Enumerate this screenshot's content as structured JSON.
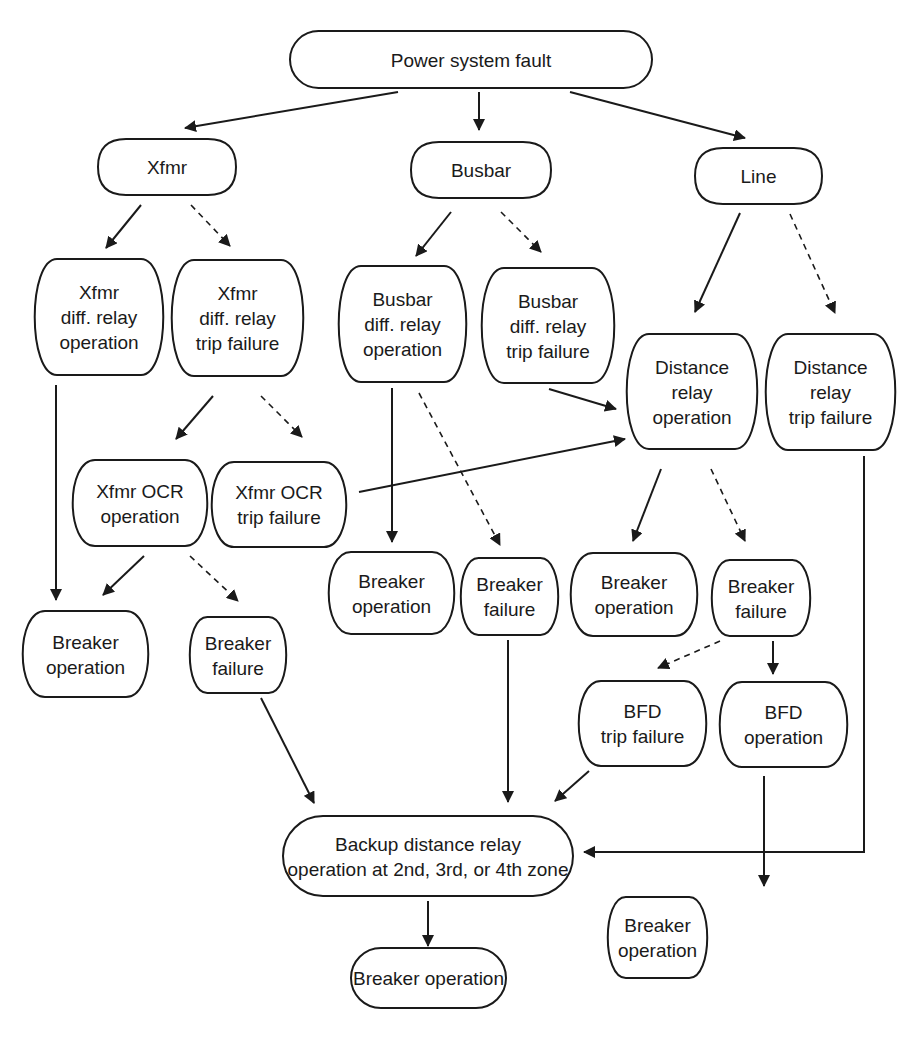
{
  "diagram": {
    "colors": {
      "stroke": "#1a1a1a",
      "fill": "#ffffff",
      "text": "#1a1a1a"
    },
    "nodes": [
      {
        "id": "fault",
        "shape": "pill",
        "x": 290,
        "y": 31,
        "w": 362,
        "h": 57,
        "lines": [
          "Power system fault"
        ]
      },
      {
        "id": "xfmr",
        "shape": "rounded",
        "x": 98,
        "y": 139,
        "w": 138,
        "h": 56,
        "lines": [
          "Xfmr"
        ]
      },
      {
        "id": "busbar",
        "shape": "rounded",
        "x": 411,
        "y": 142,
        "w": 140,
        "h": 56,
        "lines": [
          "Busbar"
        ]
      },
      {
        "id": "line",
        "shape": "rounded",
        "x": 695,
        "y": 148,
        "w": 127,
        "h": 56,
        "lines": [
          "Line"
        ]
      },
      {
        "id": "xfmr_diff_op",
        "shape": "barrel",
        "x": 35,
        "y": 259,
        "w": 128,
        "h": 116,
        "lines": [
          "Xfmr",
          "diff. relay",
          "operation"
        ]
      },
      {
        "id": "xfmr_diff_fail",
        "shape": "barrel",
        "x": 172,
        "y": 260,
        "w": 131,
        "h": 116,
        "lines": [
          "Xfmr",
          "diff. relay",
          "trip failure"
        ]
      },
      {
        "id": "busbar_diff_op",
        "shape": "barrel",
        "x": 339,
        "y": 266,
        "w": 127,
        "h": 116,
        "lines": [
          "Busbar",
          "diff. relay",
          "operation"
        ]
      },
      {
        "id": "busbar_diff_fail",
        "shape": "barrel",
        "x": 482,
        "y": 268,
        "w": 132,
        "h": 115,
        "lines": [
          "Busbar",
          "diff. relay",
          "trip failure"
        ]
      },
      {
        "id": "dist_op",
        "shape": "barrel",
        "x": 627,
        "y": 334,
        "w": 130,
        "h": 115,
        "lines": [
          "Distance",
          "relay",
          "operation"
        ]
      },
      {
        "id": "dist_fail",
        "shape": "barrel",
        "x": 766,
        "y": 334,
        "w": 129,
        "h": 116,
        "lines": [
          "Distance",
          "relay",
          "trip failure"
        ]
      },
      {
        "id": "xfmr_ocr_op",
        "shape": "barrel",
        "x": 73,
        "y": 460,
        "w": 134,
        "h": 86,
        "lines": [
          "Xfmr OCR",
          "operation"
        ]
      },
      {
        "id": "xfmr_ocr_fail",
        "shape": "barrel",
        "x": 212,
        "y": 462,
        "w": 134,
        "h": 85,
        "lines": [
          "Xfmr OCR",
          "trip failure"
        ]
      },
      {
        "id": "brk_op_busbar",
        "shape": "barrel",
        "x": 329,
        "y": 552,
        "w": 125,
        "h": 82,
        "lines": [
          "Breaker",
          "operation"
        ]
      },
      {
        "id": "brk_fail_busbar",
        "shape": "barrel",
        "x": 461,
        "y": 558,
        "w": 97,
        "h": 77,
        "lines": [
          "Breaker",
          "failure"
        ]
      },
      {
        "id": "brk_op_dist",
        "shape": "barrel",
        "x": 571,
        "y": 553,
        "w": 126,
        "h": 83,
        "lines": [
          "Breaker",
          "operation"
        ]
      },
      {
        "id": "brk_fail_dist",
        "shape": "barrel",
        "x": 712,
        "y": 560,
        "w": 98,
        "h": 76,
        "lines": [
          "Breaker",
          "failure"
        ]
      },
      {
        "id": "brk_op_left",
        "shape": "barrel",
        "x": 23,
        "y": 611,
        "w": 125,
        "h": 86,
        "lines": [
          "Breaker",
          "operation"
        ]
      },
      {
        "id": "brk_fail_left",
        "shape": "barrel",
        "x": 190,
        "y": 617,
        "w": 96,
        "h": 76,
        "lines": [
          "Breaker",
          "failure"
        ]
      },
      {
        "id": "bfd_fail",
        "shape": "barrel",
        "x": 579,
        "y": 681,
        "w": 127,
        "h": 85,
        "lines": [
          "BFD",
          "trip failure"
        ]
      },
      {
        "id": "bfd_op",
        "shape": "barrel",
        "x": 720,
        "y": 682,
        "w": 127,
        "h": 85,
        "lines": [
          "BFD",
          "operation"
        ]
      },
      {
        "id": "backup",
        "shape": "pill",
        "x": 283,
        "y": 816,
        "w": 290,
        "h": 80,
        "lines": [
          "Backup distance relay",
          "operation at 2nd, 3rd, or 4th zone"
        ]
      },
      {
        "id": "brk_op_bottom",
        "shape": "pill",
        "x": 351,
        "y": 948,
        "w": 155,
        "h": 60,
        "lines": [
          "Breaker operation"
        ]
      },
      {
        "id": "brk_op_right",
        "shape": "barrel",
        "x": 608,
        "y": 897,
        "w": 99,
        "h": 81,
        "lines": [
          "Breaker",
          "operation"
        ]
      }
    ],
    "edges": [
      {
        "from": "fault",
        "to": "xfmr",
        "style": "solid",
        "points": [
          [
            398,
            92
          ],
          [
            185,
            128
          ]
        ]
      },
      {
        "from": "fault",
        "to": "busbar",
        "style": "solid",
        "points": [
          [
            479,
            92
          ],
          [
            479,
            130
          ]
        ]
      },
      {
        "from": "fault",
        "to": "line",
        "style": "solid",
        "points": [
          [
            570,
            92
          ],
          [
            745,
            138
          ]
        ]
      },
      {
        "from": "xfmr",
        "to": "xfmr_diff_op",
        "style": "solid",
        "points": [
          [
            141,
            205
          ],
          [
            106,
            248
          ]
        ]
      },
      {
        "from": "xfmr",
        "to": "xfmr_diff_fail",
        "style": "dashed",
        "points": [
          [
            191,
            205
          ],
          [
            230,
            246
          ]
        ]
      },
      {
        "from": "busbar",
        "to": "busbar_diff_op",
        "style": "solid",
        "points": [
          [
            451,
            212
          ],
          [
            416,
            256
          ]
        ]
      },
      {
        "from": "busbar",
        "to": "busbar_diff_fail",
        "style": "dashed",
        "points": [
          [
            501,
            212
          ],
          [
            541,
            252
          ]
        ]
      },
      {
        "from": "line",
        "to": "dist_op",
        "style": "solid",
        "points": [
          [
            740,
            213
          ],
          [
            695,
            312
          ]
        ]
      },
      {
        "from": "line",
        "to": "dist_fail",
        "style": "dashed",
        "points": [
          [
            790,
            214
          ],
          [
            835,
            313
          ]
        ]
      },
      {
        "from": "xfmr_diff_fail",
        "to": "xfmr_ocr_op",
        "style": "solid",
        "points": [
          [
            213,
            396
          ],
          [
            176,
            439
          ]
        ]
      },
      {
        "from": "xfmr_diff_fail",
        "to": "xfmr_ocr_fail",
        "style": "dashed",
        "points": [
          [
            261,
            396
          ],
          [
            302,
            437
          ]
        ]
      },
      {
        "from": "busbar_diff_fail",
        "to": "dist_op",
        "style": "solid",
        "points": [
          [
            549,
            389
          ],
          [
            616,
            409
          ]
        ]
      },
      {
        "from": "xfmr_ocr_fail",
        "to": "dist_op",
        "style": "solid",
        "points": [
          [
            359,
            492
          ],
          [
            625,
            439
          ]
        ]
      },
      {
        "from": "xfmr_diff_op",
        "to": "brk_op_left",
        "style": "solid",
        "points": [
          [
            56,
            385
          ],
          [
            56,
            600
          ]
        ]
      },
      {
        "from": "busbar_diff_op",
        "to": "brk_op_busbar",
        "style": "solid",
        "points": [
          [
            392,
            388
          ],
          [
            392,
            542
          ]
        ]
      },
      {
        "from": "busbar_diff_op",
        "to": "brk_fail_busbar",
        "style": "dashed",
        "points": [
          [
            419,
            393
          ],
          [
            500,
            545
          ]
        ]
      },
      {
        "from": "dist_op",
        "to": "brk_op_dist",
        "style": "solid",
        "points": [
          [
            661,
            469
          ],
          [
            633,
            541
          ]
        ]
      },
      {
        "from": "dist_op",
        "to": "brk_fail_dist",
        "style": "dashed",
        "points": [
          [
            711,
            469
          ],
          [
            745,
            541
          ]
        ]
      },
      {
        "from": "xfmr_ocr_op",
        "to": "brk_op_left",
        "style": "solid",
        "points": [
          [
            144,
            556
          ],
          [
            103,
            595
          ]
        ]
      },
      {
        "from": "xfmr_ocr_op",
        "to": "brk_fail_left",
        "style": "dashed",
        "points": [
          [
            190,
            556
          ],
          [
            238,
            601
          ]
        ]
      },
      {
        "from": "brk_fail_dist",
        "to": "bfd_fail",
        "style": "dashed",
        "points": [
          [
            720,
            641
          ],
          [
            658,
            668
          ]
        ]
      },
      {
        "from": "brk_fail_dist",
        "to": "bfd_op",
        "style": "solid",
        "points": [
          [
            773,
            641
          ],
          [
            773,
            674
          ]
        ]
      },
      {
        "from": "brk_fail_left",
        "to": "backup",
        "style": "solid",
        "points": [
          [
            261,
            698
          ],
          [
            314,
            803
          ]
        ]
      },
      {
        "from": "brk_fail_busbar",
        "to": "backup",
        "style": "solid",
        "points": [
          [
            508,
            640
          ],
          [
            508,
            802
          ]
        ]
      },
      {
        "from": "bfd_fail",
        "to": "backup",
        "style": "solid",
        "points": [
          [
            589,
            771
          ],
          [
            555,
            801
          ]
        ]
      },
      {
        "from": "dist_fail",
        "to": "backup",
        "style": "solid",
        "points": [
          [
            864,
            456
          ],
          [
            864,
            852
          ],
          [
            584,
            852
          ]
        ]
      },
      {
        "from": "bfd_op",
        "to": "brk_op_right",
        "style": "solid",
        "points": [
          [
            764,
            776
          ],
          [
            764,
            886
          ]
        ]
      },
      {
        "from": "backup",
        "to": "brk_op_bottom",
        "style": "solid",
        "points": [
          [
            428,
            901
          ],
          [
            428,
            946
          ]
        ]
      }
    ]
  }
}
